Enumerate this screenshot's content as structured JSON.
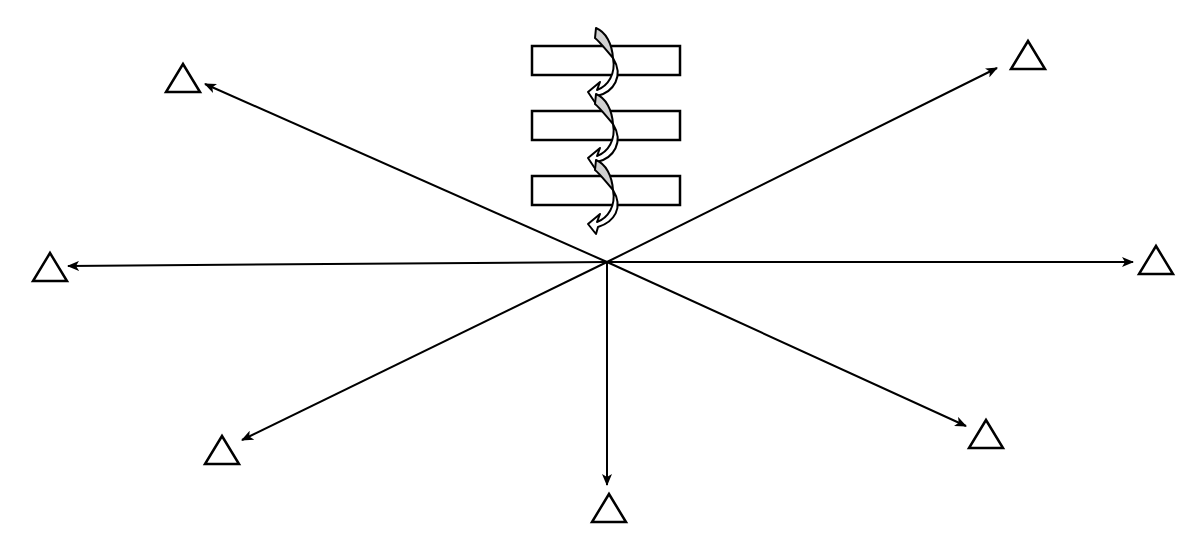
{
  "diagram": {
    "type": "radial-arrows-with-helix",
    "center": {
      "x": 607,
      "y": 262
    },
    "arrows": [
      {
        "direction": "upper-left",
        "tip": {
          "x": 205,
          "y": 84
        },
        "triangle": {
          "x": 183,
          "y": 80
        }
      },
      {
        "direction": "upper-right",
        "tip": {
          "x": 997,
          "y": 68
        },
        "triangle": {
          "x": 1028,
          "y": 57
        }
      },
      {
        "direction": "left",
        "tip": {
          "x": 68,
          "y": 266
        },
        "triangle": {
          "x": 50,
          "y": 268
        }
      },
      {
        "direction": "right",
        "tip": {
          "x": 1133,
          "y": 262
        },
        "triangle": {
          "x": 1156,
          "y": 262
        }
      },
      {
        "direction": "lower-left",
        "tip": {
          "x": 242,
          "y": 440
        },
        "triangle": {
          "x": 222,
          "y": 451
        }
      },
      {
        "direction": "lower-right",
        "tip": {
          "x": 966,
          "y": 426
        },
        "triangle": {
          "x": 986,
          "y": 436
        }
      },
      {
        "direction": "down",
        "tip": {
          "x": 607,
          "y": 485
        },
        "triangle": {
          "x": 609,
          "y": 510
        }
      }
    ],
    "membrane_segments": [
      {
        "x": 532,
        "y": 46,
        "width": 148,
        "height": 29
      },
      {
        "x": 532,
        "y": 111,
        "width": 148,
        "height": 29
      },
      {
        "x": 532,
        "y": 176,
        "width": 148,
        "height": 29
      }
    ],
    "helix": {
      "turns": 3,
      "fill_color": "#d0d0d0",
      "stroke_color": "#000000"
    },
    "colors": {
      "stroke": "#000000",
      "background": "#ffffff",
      "helix_shade": "#d0d0d0"
    }
  }
}
